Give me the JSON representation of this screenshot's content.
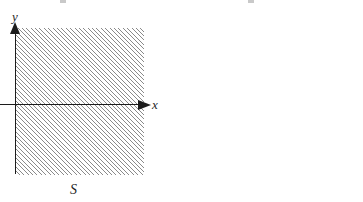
{
  "figure": {
    "background_color": "#ffffff",
    "ink_color": "#1c1c1c",
    "hatch_color": "#8a8a8a"
  },
  "panels": [
    {
      "id": "left",
      "caption": "S",
      "axes": {
        "x_label": "x",
        "y_label": "y"
      },
      "tick_labels": [],
      "region": {
        "name": "hatched-region-S",
        "fill": "diagonal-hatch-45deg",
        "description": "half-plane to the right of the y-axis"
      }
    },
    {
      "id": "right",
      "caption": "f(S)",
      "axes": {
        "x_label": "x",
        "y_label": "y"
      },
      "tick_labels": [
        "1"
      ],
      "region": {
        "name": "hatched-region-fS",
        "fill": "diagonal-hatch-45deg",
        "description": "half-plane to the right of the vertical line x = 1"
      }
    }
  ],
  "icons": {
    "x_arrow": "arrow-right-icon",
    "y_arrow": "arrow-up-icon"
  }
}
